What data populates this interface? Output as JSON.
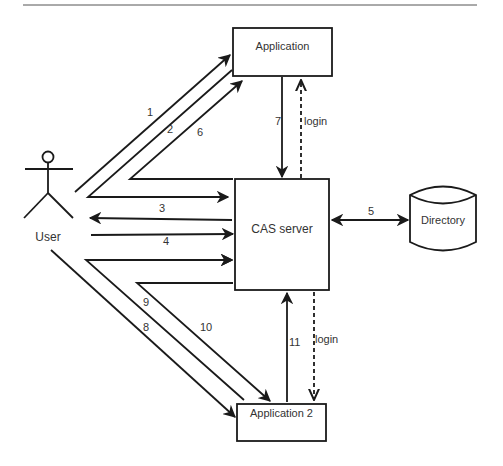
{
  "diagram": {
    "nodes": {
      "user": {
        "label": "User"
      },
      "application": {
        "label": "Application"
      },
      "cas_server": {
        "label": "CAS server"
      },
      "directory": {
        "label": "Directory"
      },
      "application2": {
        "label": "Application 2"
      }
    },
    "edges": [
      {
        "id": "1",
        "label": "1",
        "from": "User",
        "to": "Application"
      },
      {
        "id": "2",
        "label": "2",
        "from": "Application",
        "to": "User"
      },
      {
        "id": "6",
        "label": "6",
        "from": "CAS server",
        "to": "Application"
      },
      {
        "id": "3",
        "label": "3",
        "from": "CAS server",
        "to": "User"
      },
      {
        "id": "4",
        "label": "4",
        "from": "User",
        "to": "CAS server"
      },
      {
        "id": "5",
        "label": "5",
        "from": "CAS server",
        "to": "Directory",
        "bidirectional": true
      },
      {
        "id": "7",
        "label": "7",
        "from": "Application",
        "to": "CAS server"
      },
      {
        "id": "login1",
        "label": "login",
        "from": "CAS server",
        "to": "Application",
        "dashed": true
      },
      {
        "id": "8",
        "label": "8",
        "from": "User",
        "to": "Application 2"
      },
      {
        "id": "9",
        "label": "9",
        "from": "Application 2",
        "to": "CAS server"
      },
      {
        "id": "10",
        "label": "10",
        "from": "CAS server",
        "to": "Application 2"
      },
      {
        "id": "11",
        "label": "11",
        "from": "Application 2",
        "to": "CAS server"
      },
      {
        "id": "login2",
        "label": "login",
        "from": "CAS server",
        "to": "Application 2",
        "dashed": true
      }
    ]
  }
}
